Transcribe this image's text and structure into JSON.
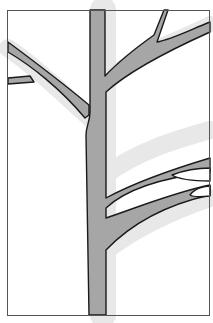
{
  "image": {
    "subject": "tree-branches-illustration",
    "colors": {
      "background": "#ffffff",
      "branch_fill": "#a6a6a6",
      "shadow": "#e6e6e6",
      "outline": "#1a1a1a",
      "frame": "#555555"
    }
  }
}
